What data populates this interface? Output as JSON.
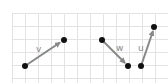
{
  "diagram": {
    "grid": {
      "x0": 12,
      "y0": 13,
      "step": 13,
      "cols": 12,
      "rows": 5,
      "color": "#e3e3e3"
    },
    "vectors": [
      {
        "label": "v",
        "from": [
          25,
          66
        ],
        "to": [
          64,
          40
        ],
        "label_pos": [
          36,
          48
        ]
      },
      {
        "label": "w",
        "from": [
          102,
          40
        ],
        "to": [
          128,
          66
        ],
        "label_pos": [
          117,
          49
        ]
      },
      {
        "label": "u",
        "from": [
          141,
          66
        ],
        "to": [
          154,
          27
        ],
        "label_pos": [
          140,
          47
        ]
      }
    ],
    "colors": {
      "arrow": "#888888",
      "point": "#111111",
      "label": "#888888"
    }
  }
}
